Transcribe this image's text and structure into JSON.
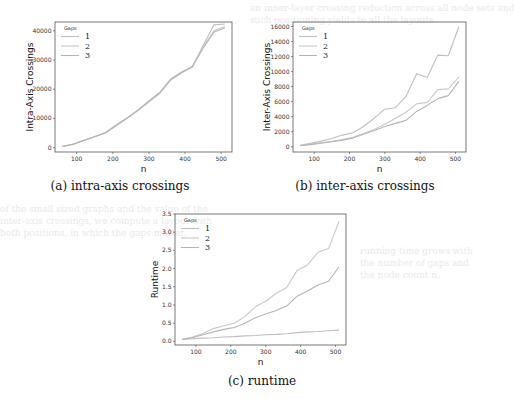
{
  "figure": {
    "captions": [
      "(a) intra-axis crossings",
      "(b) inter-axis crossings",
      "(c) runtime"
    ],
    "line_colors": [
      "#bfbfbf",
      "#c9c9c9",
      "#b5b5b5"
    ]
  },
  "chart_data": [
    {
      "type": "line",
      "title": "",
      "caption": "(a) intra-axis crossings",
      "xlabel": "n",
      "ylabel": "Intra-Axis Crossings",
      "xlim": [
        40,
        530
      ],
      "ylim": [
        -1500,
        43000
      ],
      "xticks": [
        100,
        200,
        300,
        400,
        500
      ],
      "yticks": [
        0,
        10000,
        20000,
        30000,
        40000
      ],
      "ytick_labels": [
        "0",
        "10000",
        "20000",
        "30000",
        "40000"
      ],
      "legend": {
        "title": "Gaps",
        "entries": [
          "1",
          "2",
          "3"
        ],
        "position": "upper left"
      },
      "grid": false,
      "x": [
        60,
        90,
        120,
        150,
        180,
        210,
        240,
        270,
        300,
        330,
        360,
        390,
        420,
        450,
        480,
        510
      ],
      "series": [
        {
          "name": "1",
          "values": [
            400,
            1200,
            2500,
            3800,
            5200,
            7800,
            10200,
            12800,
            15800,
            18700,
            23500,
            25800,
            27800,
            35000,
            42000,
            42300
          ]
        },
        {
          "name": "2",
          "values": [
            350,
            1100,
            2400,
            3700,
            5000,
            7500,
            10000,
            12700,
            15600,
            18500,
            23000,
            25500,
            27500,
            34500,
            40000,
            41500
          ]
        },
        {
          "name": "3",
          "values": [
            380,
            1150,
            2450,
            3750,
            5100,
            7700,
            10100,
            12900,
            16000,
            19000,
            23300,
            25700,
            27700,
            34000,
            39500,
            41000
          ]
        }
      ]
    },
    {
      "type": "line",
      "title": "",
      "caption": "(b) inter-axis crossings",
      "xlabel": "n",
      "ylabel": "Inter-Axis Crossings",
      "xlim": [
        40,
        530
      ],
      "ylim": [
        -700,
        16600
      ],
      "xticks": [
        100,
        200,
        300,
        400,
        500
      ],
      "yticks": [
        0,
        2000,
        4000,
        6000,
        8000,
        10000,
        12000,
        14000,
        16000
      ],
      "ytick_labels": [
        "0",
        "2000",
        "4000",
        "6000",
        "8000",
        "10000",
        "12000",
        "14000",
        "16000"
      ],
      "legend": {
        "title": "Gaps",
        "entries": [
          "1",
          "2",
          "3"
        ],
        "position": "upper left"
      },
      "grid": false,
      "x": [
        60,
        90,
        120,
        150,
        180,
        210,
        240,
        270,
        300,
        330,
        360,
        390,
        420,
        450,
        480,
        510
      ],
      "series": [
        {
          "name": "1",
          "values": [
            200,
            450,
            750,
            1100,
            1550,
            1850,
            2700,
            3800,
            5000,
            5200,
            6700,
            9700,
            9200,
            12200,
            12100,
            16000
          ]
        },
        {
          "name": "2",
          "values": [
            150,
            330,
            520,
            720,
            950,
            1250,
            1750,
            2300,
            3000,
            3800,
            4600,
            5700,
            5900,
            7600,
            7700,
            9300
          ]
        },
        {
          "name": "3",
          "values": [
            120,
            280,
            460,
            660,
            880,
            1150,
            1650,
            2150,
            2700,
            3100,
            3500,
            4700,
            5500,
            6400,
            6800,
            8700
          ]
        }
      ]
    },
    {
      "type": "line",
      "title": "",
      "caption": "(c) runtime",
      "xlabel": "n",
      "ylabel": "Runtime",
      "xlim": [
        40,
        530
      ],
      "ylim": [
        -0.1,
        3.5
      ],
      "xticks": [
        100,
        200,
        300,
        400,
        500
      ],
      "yticks": [
        0.0,
        0.5,
        1.0,
        1.5,
        2.0,
        2.5,
        3.0,
        3.5
      ],
      "ytick_labels": [
        "0.0",
        "0.5",
        "1.0",
        "1.5",
        "2.0",
        "2.5",
        "3.0",
        "3.5"
      ],
      "legend": {
        "title": "Gaps",
        "entries": [
          "1",
          "2",
          "3"
        ],
        "position": "upper left"
      },
      "grid": false,
      "x": [
        60,
        90,
        120,
        150,
        180,
        210,
        240,
        270,
        300,
        330,
        360,
        390,
        420,
        450,
        480,
        510
      ],
      "series": [
        {
          "name": "1",
          "values": [
            0.05,
            0.07,
            0.09,
            0.1,
            0.12,
            0.13,
            0.15,
            0.16,
            0.18,
            0.19,
            0.21,
            0.24,
            0.26,
            0.27,
            0.29,
            0.31
          ]
        },
        {
          "name": "2",
          "values": [
            0.06,
            0.12,
            0.22,
            0.35,
            0.43,
            0.5,
            0.68,
            0.95,
            1.1,
            1.32,
            1.48,
            1.95,
            2.1,
            2.45,
            2.55,
            3.3
          ]
        },
        {
          "name": "3",
          "values": [
            0.05,
            0.1,
            0.18,
            0.26,
            0.33,
            0.38,
            0.5,
            0.65,
            0.75,
            0.85,
            0.97,
            1.24,
            1.38,
            1.55,
            1.65,
            2.05
          ]
        }
      ]
    }
  ]
}
